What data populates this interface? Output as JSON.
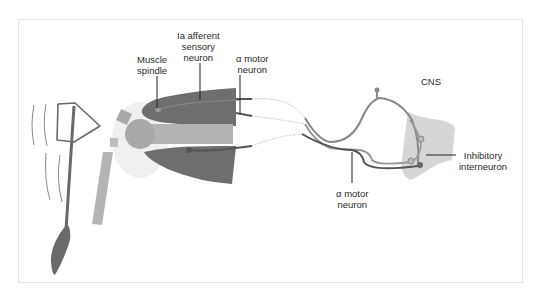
{
  "figure": {
    "colors": {
      "muscle_dark": "#6e6e6e",
      "bone": "#a9a9a9",
      "bone_light": "#bdbdbd",
      "joint_glow": "#ebebeb",
      "neuron": "#8a8a8a",
      "neuron_dark": "#555555",
      "cns": "#cfcfcf",
      "hammer": "#6a6a6a",
      "leader_line": "#222222",
      "frame_border": "#e3e3e3"
    }
  },
  "labels": {
    "muscle_spindle": [
      "Muscle",
      "spindle"
    ],
    "ia_afferent": [
      "Ia afferent",
      "sensory",
      "neuron"
    ],
    "alpha_motor_top": [
      "α motor",
      "neuron"
    ],
    "alpha_motor_bottom": [
      "α motor",
      "neuron"
    ],
    "cns": "CNS",
    "inhibitory_interneuron": [
      "Inhibitory",
      "interneuron"
    ]
  },
  "elements": {
    "reflex_hammer": "reflex-hammer",
    "quadriceps_muscle": "extensor-muscle",
    "hamstring_muscle": "flexor-muscle",
    "femur": "femur-bone",
    "patella": "patella",
    "tibia": "tibia-bone",
    "spinal_cord": "spinal-cord"
  }
}
